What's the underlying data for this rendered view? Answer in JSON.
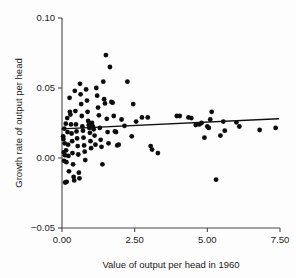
{
  "chart_data": {
    "type": "scatter",
    "title": "",
    "xlabel": "Value of output per head in 1960",
    "ylabel": "Growth rate of output per head",
    "xlim": [
      0.0,
      7.5
    ],
    "ylim": [
      -0.05,
      0.1
    ],
    "xticks": [
      0.0,
      2.5,
      5.0,
      7.5
    ],
    "xtick_labels": [
      "0.00",
      "2.50",
      "5.00",
      "7.50"
    ],
    "yticks": [
      -0.05,
      0.0,
      0.05,
      0.1
    ],
    "ytick_labels": [
      "-0.05",
      "0.00",
      "0.05",
      "0.10"
    ],
    "grid": false,
    "legend": "none",
    "marker": "filled-circle",
    "marker_color": "#0d0d0d",
    "series": [
      {
        "name": "countries",
        "type": "scatter",
        "points": [
          [
            0.04,
            0.0155
          ],
          [
            0.05,
            0.0135
          ],
          [
            0.06,
            0.004
          ],
          [
            0.07,
            -0.002
          ],
          [
            0.08,
            0.021
          ],
          [
            0.09,
            0.0105
          ],
          [
            0.1,
            0.002
          ],
          [
            0.11,
            -0.0175
          ],
          [
            0.13,
            0.0245
          ],
          [
            0.14,
            0.0055
          ],
          [
            0.15,
            -0.003
          ],
          [
            0.16,
            -0.017
          ],
          [
            0.18,
            0.0285
          ],
          [
            0.19,
            0.0185
          ],
          [
            0.21,
            0.0095
          ],
          [
            0.22,
            0.0015
          ],
          [
            0.24,
            -0.0095
          ],
          [
            0.26,
            0.043
          ],
          [
            0.27,
            0.033
          ],
          [
            0.29,
            0.031
          ],
          [
            0.31,
            0.024
          ],
          [
            0.33,
            0.0175
          ],
          [
            0.35,
            0.012
          ],
          [
            0.36,
            0.0035
          ],
          [
            0.38,
            -0.0045
          ],
          [
            0.4,
            -0.0135
          ],
          [
            0.42,
            -0.016
          ],
          [
            0.44,
            0.048
          ],
          [
            0.46,
            0.0335
          ],
          [
            0.48,
            0.024
          ],
          [
            0.5,
            0.019
          ],
          [
            0.52,
            0.014
          ],
          [
            0.54,
            0.0085
          ],
          [
            0.56,
            0.0025
          ],
          [
            0.58,
            -0.0105
          ],
          [
            0.6,
            -0.0145
          ],
          [
            0.62,
            0.053
          ],
          [
            0.64,
            0.0455
          ],
          [
            0.66,
            0.0385
          ],
          [
            0.68,
            0.03
          ],
          [
            0.7,
            0.0225
          ],
          [
            0.72,
            0.0195
          ],
          [
            0.74,
            0.0145
          ],
          [
            0.76,
            0.009
          ],
          [
            0.78,
            0.0045
          ],
          [
            0.8,
            -0.0015
          ],
          [
            0.83,
            0.049
          ],
          [
            0.86,
            0.041
          ],
          [
            0.88,
            0.033
          ],
          [
            0.9,
            0.0265
          ],
          [
            0.92,
            0.0235
          ],
          [
            0.94,
            0.0215
          ],
          [
            0.96,
            0.018
          ],
          [
            0.98,
            0.012
          ],
          [
            1.0,
            0.007
          ],
          [
            1.03,
            0.025
          ],
          [
            1.06,
            0.0225
          ],
          [
            1.09,
            0.0205
          ],
          [
            1.12,
            0.016
          ],
          [
            1.15,
            0.0095
          ],
          [
            1.18,
            0.05
          ],
          [
            1.21,
            0.0445
          ],
          [
            1.24,
            0.036
          ],
          [
            1.27,
            0.0305
          ],
          [
            1.3,
            0.0215
          ],
          [
            1.33,
            0.013
          ],
          [
            1.36,
            0.008
          ],
          [
            1.39,
            -0.0045
          ],
          [
            1.42,
            0.0545
          ],
          [
            1.45,
            0.042
          ],
          [
            1.48,
            0.039
          ],
          [
            1.51,
            0.0735
          ],
          [
            1.54,
            0.028
          ],
          [
            1.57,
            0.0185
          ],
          [
            1.6,
            0.0105
          ],
          [
            1.65,
            0.065
          ],
          [
            1.7,
            0.04
          ],
          [
            1.74,
            0.0395
          ],
          [
            1.78,
            0.03
          ],
          [
            1.82,
            0.019
          ],
          [
            1.86,
            0.0185
          ],
          [
            1.9,
            0.009
          ],
          [
            1.95,
            0.0095
          ],
          [
            2.05,
            0.0275
          ],
          [
            2.15,
            0.023
          ],
          [
            2.25,
            0.0545
          ],
          [
            2.4,
            0.0155
          ],
          [
            2.45,
            0.0385
          ],
          [
            2.55,
            0.026
          ],
          [
            2.75,
            0.029
          ],
          [
            2.95,
            0.029
          ],
          [
            3.05,
            0.0085
          ],
          [
            3.1,
            0.006
          ],
          [
            3.3,
            0.0035
          ],
          [
            3.95,
            0.03
          ],
          [
            4.05,
            0.03
          ],
          [
            4.35,
            0.029
          ],
          [
            4.45,
            0.0285
          ],
          [
            4.6,
            0.0235
          ],
          [
            4.72,
            0.024
          ],
          [
            4.8,
            0.025
          ],
          [
            4.9,
            0.0145
          ],
          [
            5.0,
            0.0225
          ],
          [
            5.05,
            0.0215
          ],
          [
            5.1,
            0.0275
          ],
          [
            5.15,
            0.033
          ],
          [
            5.3,
            -0.0155
          ],
          [
            5.45,
            0.016
          ],
          [
            5.55,
            0.026
          ],
          [
            5.6,
            0.0195
          ],
          [
            6.0,
            0.0255
          ],
          [
            6.1,
            0.0225
          ],
          [
            6.8,
            0.02
          ],
          [
            7.35,
            0.0215
          ]
        ]
      }
    ],
    "fit_line": {
      "name": "regression-line",
      "type": "line",
      "x": [
        0.0,
        7.45
      ],
      "y": [
        0.0208,
        0.028
      ],
      "slope": 0.00097,
      "intercept": 0.0208
    }
  }
}
